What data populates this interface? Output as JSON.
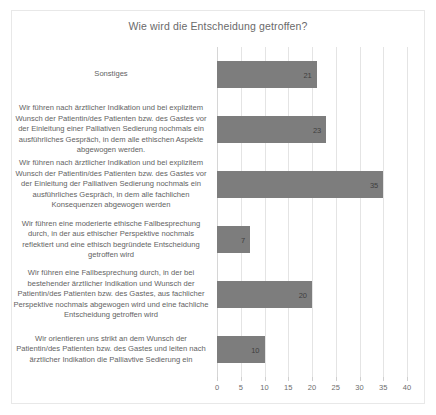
{
  "chart_data": {
    "type": "bar",
    "orientation": "horizontal",
    "title": "Wie wird die Entscheidung getroffen?",
    "xlabel": "",
    "ylabel": "",
    "xlim": [
      0,
      40
    ],
    "xticks": [
      0,
      5,
      10,
      15,
      20,
      25,
      30,
      35,
      40
    ],
    "grid": true,
    "legend": false,
    "bar_color": "#7d7d7d",
    "categories": [
      "Sonstiges",
      "Wir führen nach ärztlicher Indikation und bei explizitem Wunsch der Patientin/des Patienten bzw. des Gastes vor der Einleitung einer Palliativen Sedierung nochmals ein ausführliches Gespräch, in dem alle ethischen Aspekte abgewogen werden.",
      "Wir führen nach ärztlicher Indikation und bei explizitem Wunsch der Patientin/des Patienten bzw. des Gastes vor der Einleitung der Palliativen Sedierung nochmals ein ausführliches Gespräch, in dem alle fachlichen Konsequenzen abgewogen werden",
      "Wir führen eine moderierte ethische Fallbesprechung durch, in der aus ethischer Perspektive nochmals reflektiert und eine ethisch begründete Entscheidung getroffen wird",
      "Wir führen eine Fallbesprechung durch, in der bei bestehender ärztlicher Indikation und Wunsch der Patientin/des Patienten bzw. des Gastes, aus fachlicher Perspektive nochmals abgewogen wird und eine fachliche Entscheidung getroffen wird",
      "Wir orientieren uns strikt an dem Wunsch der Patientin/des Patienten bzw. des Gastes und leiten nach ärztlicher Indikation die Palliavtive Sedierung ein"
    ],
    "values": [
      21,
      23,
      35,
      7,
      20,
      10
    ]
  }
}
